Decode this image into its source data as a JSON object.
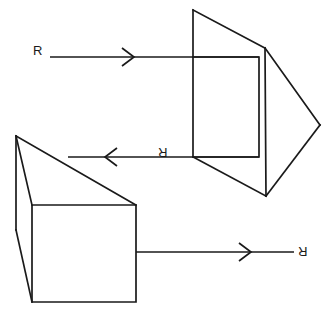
{
  "figure": {
    "background_color": "#ffffff",
    "line_color": "#1a1a1a",
    "width": 327,
    "height": 318,
    "labels": [
      {
        "id": "label-top-left",
        "text": "R",
        "x": 33,
        "y": 44,
        "rotation": 0,
        "description": "incoming ray label, upright"
      },
      {
        "id": "label-middle",
        "text": "R",
        "x": 163,
        "y": 146,
        "rotation": 180,
        "description": "reflected ray label, inverted"
      },
      {
        "id": "label-bottom-right",
        "text": "R",
        "x": 300,
        "y": 245,
        "rotation": 180,
        "description": "outgoing ray label, inverted"
      }
    ],
    "rays": [
      {
        "id": "ray-top",
        "label": "R",
        "direction": "right",
        "start_x": 50,
        "end_x": 259,
        "y": 57,
        "arrow_x": 130
      },
      {
        "id": "ray-middle",
        "label": "R",
        "direction": "left",
        "start_x": 259,
        "end_x": 68,
        "y": 157,
        "arrow_x": 112
      },
      {
        "id": "ray-bottom",
        "label": "R",
        "direction": "right",
        "start_x": 136,
        "end_x": 294,
        "y": 252,
        "arrow_x": 247
      }
    ],
    "shapes": [
      {
        "id": "upper-prism",
        "description": "upper wedge prism seen in perspective",
        "outline": "M193,10 L266,48 L320,125 L266,195 L193,157 Z",
        "edges": [
          {
            "id": "upper-prism-left-edge",
            "path": "M193,10 L193,157"
          },
          {
            "id": "upper-prism-right-edge",
            "path": "M266,48 L266,195"
          }
        ]
      },
      {
        "id": "upper-prism-face",
        "description": "front square face of upper prism",
        "outline": "M193,57 L259,57 L259,157 L193,157 Z"
      },
      {
        "id": "lower-prism",
        "description": "lower wedge prism seen in perspective",
        "outline": "M16,136 L136,205 L136,302 L32,302 L16,230 Z",
        "edges": [
          {
            "id": "lower-prism-back-edge",
            "path": "M16,136 L32,205"
          },
          {
            "id": "lower-prism-slant-edge",
            "path": "M32,205 L32,302"
          }
        ]
      },
      {
        "id": "lower-prism-face",
        "description": "front square face of lower prism",
        "outline": "M32,205 L136,205 L136,302 L32,302 Z"
      }
    ]
  }
}
